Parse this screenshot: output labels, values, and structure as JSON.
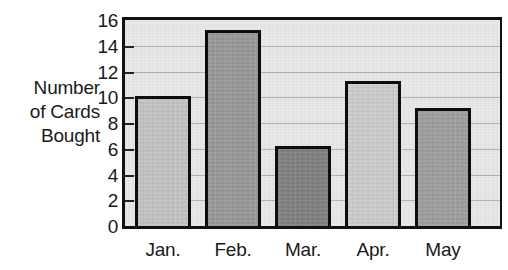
{
  "chart_data": {
    "type": "bar",
    "title": "",
    "subtitle": "",
    "xlabel": "",
    "ylabel": "Number of Cards Bought",
    "ylabel_lines": [
      "Number",
      "of Cards",
      "Bought"
    ],
    "categories": [
      "Jan.",
      "Feb.",
      "Mar.",
      "Apr.",
      "May"
    ],
    "values": [
      10.1,
      15.2,
      6.2,
      11.3,
      9.2
    ],
    "series": [
      {
        "name": "Number of Cards Bought",
        "values": [
          10.1,
          15.2,
          6.2,
          11.3,
          9.2
        ]
      }
    ],
    "bar_colors": [
      "#c8c8c8",
      "#9a9a9a",
      "#808080",
      "#d2d2d2",
      "#a0a0a0"
    ],
    "bar_outline_color": "#0d0d0d",
    "ylim": [
      0,
      16
    ],
    "xlim_note": "plot area extends to the right beyond the last bar",
    "ytick_values": [
      0,
      2,
      4,
      6,
      8,
      10,
      12,
      14,
      16
    ],
    "ytick_labels": [
      "0",
      "2",
      "4",
      "6",
      "8",
      "10",
      "12",
      "14",
      "16"
    ],
    "gridlines": {
      "horizontal": true,
      "vertical": false,
      "at_values": [
        2,
        4,
        6,
        8,
        10,
        12,
        14
      ],
      "color": "#b4b4b4"
    },
    "legend": {
      "present": false,
      "position": "none",
      "entries": []
    },
    "annotations": [],
    "plot_background_color": "#e9e9e9",
    "frame_color": "#111111",
    "figure_background_color": "#ffffff"
  }
}
